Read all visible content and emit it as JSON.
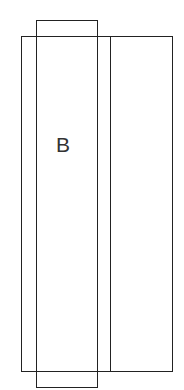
{
  "diagram": {
    "type": "panel-layout",
    "shapes": [
      {
        "id": "outer-frame",
        "kind": "rectangle",
        "x": 21,
        "y": 36,
        "width": 152,
        "height": 336
      },
      {
        "id": "right-panel-divider",
        "kind": "line",
        "x": 111,
        "y1": 36,
        "y2": 372
      },
      {
        "id": "panel-b",
        "kind": "rectangle",
        "x": 36,
        "y": 20,
        "width": 62,
        "height": 368,
        "label": "B"
      }
    ],
    "labels": {
      "panel_b": "B"
    },
    "stroke_color": "#222222",
    "background": "#ffffff"
  }
}
